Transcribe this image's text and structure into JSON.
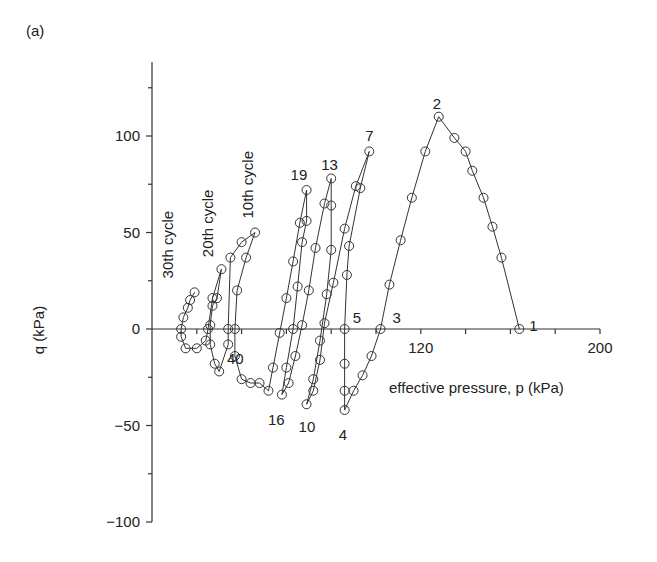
{
  "figure": {
    "panel_label": "(a)"
  },
  "chart_data": {
    "type": "line",
    "title": "",
    "xlabel": "effective pressure, p (kPa)",
    "ylabel": "q (kPa)",
    "xlim": [
      0,
      200
    ],
    "ylim": [
      -100,
      140
    ],
    "x_ticks": [
      40,
      120,
      200
    ],
    "x_tick_labels": [
      "40",
      "120",
      "200"
    ],
    "x_minor_ticks": [
      20,
      40,
      60,
      80,
      100,
      120,
      140,
      160,
      180,
      200
    ],
    "y_ticks": [
      -100,
      -50,
      0,
      50,
      100
    ],
    "y_tick_labels": [
      "−100",
      "−50",
      "0",
      "50",
      "100"
    ],
    "y_minor_ticks": [
      -75,
      -25,
      25,
      75,
      125
    ],
    "grid": false,
    "legend": null,
    "marker": "open-circle",
    "point_annotations": [
      {
        "label": "1",
        "p": 164,
        "q": 0
      },
      {
        "label": "2",
        "p": 128,
        "q": 110
      },
      {
        "label": "3",
        "p": 102,
        "q": 0
      },
      {
        "label": "4",
        "p": 86,
        "q": -42
      },
      {
        "label": "5",
        "p": 86,
        "q": 0
      },
      {
        "label": "7",
        "p": 97,
        "q": 92
      },
      {
        "label": "10",
        "p": 69,
        "q": -39
      },
      {
        "label": "13",
        "p": 80,
        "q": 78
      },
      {
        "label": "16",
        "p": 58,
        "q": -34
      },
      {
        "label": "19",
        "p": 69,
        "q": 72
      },
      {
        "label": "40",
        "p": 37,
        "q": -14
      }
    ],
    "cycle_annotations": [
      {
        "label": "30th cycle",
        "p": 12,
        "q": 20
      },
      {
        "label": "20th cycle",
        "p": 29,
        "q": 31
      },
      {
        "label": "10th cycle",
        "p": 46,
        "q": 50
      }
    ],
    "series": [
      {
        "name": "stress path",
        "points": [
          [
            164,
            0
          ],
          [
            156,
            37
          ],
          [
            152,
            53
          ],
          [
            148,
            68
          ],
          [
            143,
            82
          ],
          [
            140,
            92
          ],
          [
            135,
            99
          ],
          [
            128,
            110
          ],
          [
            122,
            92
          ],
          [
            116,
            68
          ],
          [
            111,
            46
          ],
          [
            106,
            23
          ],
          [
            102,
            0
          ],
          [
            98,
            -14
          ],
          [
            94,
            -24
          ],
          [
            90,
            -32
          ],
          [
            86,
            -42
          ],
          [
            86,
            -32
          ],
          [
            86,
            -18
          ],
          [
            86,
            0
          ],
          [
            87,
            28
          ],
          [
            88,
            43
          ],
          [
            93,
            73
          ],
          [
            97,
            92
          ],
          [
            91,
            74
          ],
          [
            86,
            52
          ],
          [
            81,
            24
          ],
          [
            77,
            3
          ],
          [
            75,
            -16
          ],
          [
            72,
            -32
          ],
          [
            69,
            -39
          ],
          [
            72,
            -26
          ],
          [
            75,
            -6
          ],
          [
            78,
            18
          ],
          [
            80,
            41
          ],
          [
            80,
            64
          ],
          [
            80,
            78
          ],
          [
            77,
            65
          ],
          [
            73,
            42
          ],
          [
            70,
            20
          ],
          [
            67,
            2
          ],
          [
            64,
            -14
          ],
          [
            61,
            -28
          ],
          [
            58,
            -34
          ],
          [
            60,
            -20
          ],
          [
            63,
            0
          ],
          [
            65,
            22
          ],
          [
            67,
            45
          ],
          [
            69,
            56
          ],
          [
            69,
            72
          ],
          [
            66,
            55
          ],
          [
            63,
            35
          ],
          [
            60,
            16
          ],
          [
            57,
            -2
          ],
          [
            54,
            -20
          ],
          [
            52,
            -32
          ],
          [
            48,
            -28
          ],
          [
            44,
            -28
          ],
          [
            40,
            -26
          ],
          [
            37,
            -14
          ],
          [
            37,
            0
          ],
          [
            38,
            20
          ],
          [
            42,
            37
          ],
          [
            46,
            50
          ],
          [
            40,
            45
          ],
          [
            35,
            37
          ],
          [
            34,
            0
          ],
          [
            34,
            -8
          ],
          [
            30,
            -22
          ],
          [
            28,
            -18
          ],
          [
            26,
            -8
          ],
          [
            26,
            2
          ],
          [
            27,
            12
          ],
          [
            29,
            16
          ],
          [
            31,
            31
          ],
          [
            27,
            16
          ],
          [
            25,
            0
          ],
          [
            24,
            -6
          ],
          [
            20,
            -10
          ],
          [
            15,
            -10
          ],
          [
            13,
            -4
          ],
          [
            13,
            0
          ],
          [
            14,
            6
          ],
          [
            16,
            11
          ],
          [
            17,
            15
          ],
          [
            19,
            19
          ]
        ]
      }
    ]
  }
}
